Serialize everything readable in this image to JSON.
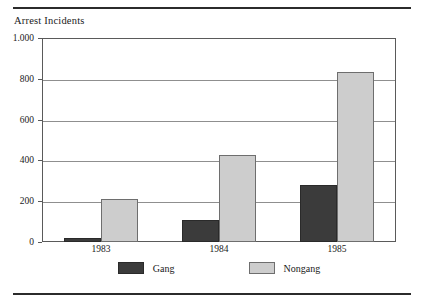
{
  "chart_data": {
    "type": "bar",
    "title": "",
    "ylabel": "Arrest Incidents",
    "xlabel": "",
    "categories": [
      "1983",
      "1984",
      "1985"
    ],
    "series": [
      {
        "name": "Gang",
        "color": "#3b3b3b",
        "values": [
          20,
          110,
          280
        ]
      },
      {
        "name": "Nongang",
        "color": "#cdcdcd",
        "values": [
          210,
          425,
          835
        ]
      }
    ],
    "ylim": [
      0,
      1000
    ],
    "yticks": [
      0,
      200,
      400,
      600,
      800,
      1000
    ],
    "ytick_labels": [
      "0",
      "200",
      "400",
      "600",
      "800",
      "1.000"
    ],
    "grid": "horizontal",
    "legend_position": "bottom"
  },
  "axis": {
    "y_title": "Arrest Incidents",
    "y_labels": [
      "1.000",
      "800",
      "600",
      "400",
      "200",
      "0"
    ],
    "x_labels": [
      "1983",
      "1984",
      "1985"
    ]
  },
  "legend": {
    "items": [
      {
        "label": "Gang"
      },
      {
        "label": "Nongang"
      }
    ]
  }
}
